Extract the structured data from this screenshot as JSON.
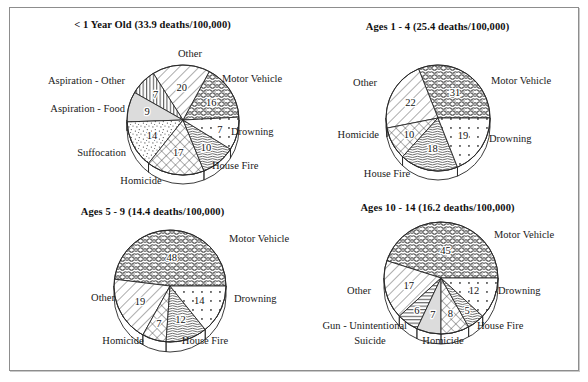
{
  "figure": {
    "border_color": "#8d8d8d",
    "background": "#ffffff"
  },
  "chart_data": [
    {
      "type": "pie",
      "title": "< 1 Year Old (33.9 deaths/100,000)",
      "age_group": "< 1 Year Old",
      "rate": "33.9 deaths/100,000",
      "unit": "percent",
      "categories": [
        "Other",
        "Motor Vehicle",
        "Drowning",
        "House Fire",
        "Homicide",
        "Suffocation",
        "Aspiration - Food",
        "Aspiration - Other"
      ],
      "values": [
        20,
        16,
        7,
        10,
        17,
        14,
        9,
        7
      ],
      "legend_position": "callout",
      "grid": false
    },
    {
      "type": "pie",
      "title": "Ages 1 - 4 (25.4 deaths/100,000)",
      "age_group": "Ages 1 - 4",
      "rate": "25.4 deaths/100,000",
      "unit": "percent",
      "categories": [
        "Motor Vehicle",
        "Drowning",
        "House Fire",
        "Homicide",
        "Other"
      ],
      "values": [
        31,
        19,
        18,
        10,
        22
      ],
      "legend_position": "callout",
      "grid": false
    },
    {
      "type": "pie",
      "title": "Ages 5 - 9 (14.4 deaths/100,000)",
      "age_group": "Ages 5 - 9",
      "rate": "14.4 deaths/100,000",
      "unit": "percent",
      "categories": [
        "Motor Vehicle",
        "Drowning",
        "House Fire",
        "Homicide",
        "Other"
      ],
      "values": [
        48,
        14,
        12,
        7,
        19
      ],
      "legend_position": "callout",
      "grid": false
    },
    {
      "type": "pie",
      "title": "Ages 10 - 14 (16.2 deaths/100,000)",
      "age_group": "Ages 10 - 14",
      "rate": "16.2 deaths/100,000",
      "unit": "percent",
      "categories": [
        "Motor Vehicle",
        "Drowning",
        "House Fire",
        "Homicide",
        "Suicide",
        "Gun - Unintentional",
        "Other"
      ],
      "values": [
        45,
        12,
        5,
        8,
        7,
        6,
        17
      ],
      "legend_position": "callout",
      "grid": false
    }
  ],
  "panels": [
    {
      "title": "< 1 Year Old (33.9 deaths/100,000)",
      "slices": [
        {
          "label": "Other",
          "value": "20"
        },
        {
          "label": "Motor Vehicle",
          "value": "16"
        },
        {
          "label": "Drowning",
          "value": "7"
        },
        {
          "label": "House Fire",
          "value": "10"
        },
        {
          "label": "Homicide",
          "value": "17"
        },
        {
          "label": "Suffocation",
          "value": "14"
        },
        {
          "label": "Aspiration - Food",
          "value": "9"
        },
        {
          "label": "Aspiration - Other",
          "value": "7"
        }
      ]
    },
    {
      "title": "Ages 1 - 4 (25.4 deaths/100,000)",
      "slices": [
        {
          "label": "Motor Vehicle",
          "value": "31"
        },
        {
          "label": "Drowning",
          "value": "19"
        },
        {
          "label": "House Fire",
          "value": "18"
        },
        {
          "label": "Homicide",
          "value": "10"
        },
        {
          "label": "Other",
          "value": "22"
        }
      ]
    },
    {
      "title": "Ages 5 - 9 (14.4 deaths/100,000)",
      "slices": [
        {
          "label": "Motor Vehicle",
          "value": "48"
        },
        {
          "label": "Drowning",
          "value": "14"
        },
        {
          "label": "House Fire",
          "value": "12"
        },
        {
          "label": "Homicide",
          "value": "7"
        },
        {
          "label": "Other",
          "value": "19"
        }
      ]
    },
    {
      "title": "Ages 10 - 14 (16.2 deaths/100,000)",
      "slices": [
        {
          "label": "Motor Vehicle",
          "value": "45"
        },
        {
          "label": "Drowning",
          "value": "12"
        },
        {
          "label": "House Fire",
          "value": "5"
        },
        {
          "label": "Homicide",
          "value": "8"
        },
        {
          "label": "Suicide",
          "value": "7"
        },
        {
          "label": "Gun - Unintentional",
          "value": "6"
        },
        {
          "label": "Other",
          "value": "17"
        }
      ]
    }
  ]
}
